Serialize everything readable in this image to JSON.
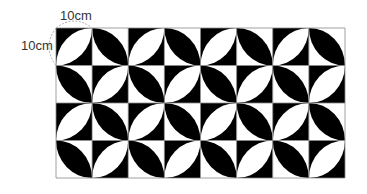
{
  "labels": {
    "width": "10cm",
    "height": "10cm"
  },
  "grid": {
    "columns": 8,
    "rows": 4,
    "left": 56,
    "top": 28,
    "width": 289,
    "height": 150
  },
  "colors": {
    "dark": "#000000",
    "light": "#ffffff",
    "gridline": "#888888",
    "annotation": "#999999"
  },
  "tiles": {
    "rule": "checkerboard: (row+col) even = white leaf on black along / diagonal; odd = black leaf on white along \\ diagonal"
  }
}
